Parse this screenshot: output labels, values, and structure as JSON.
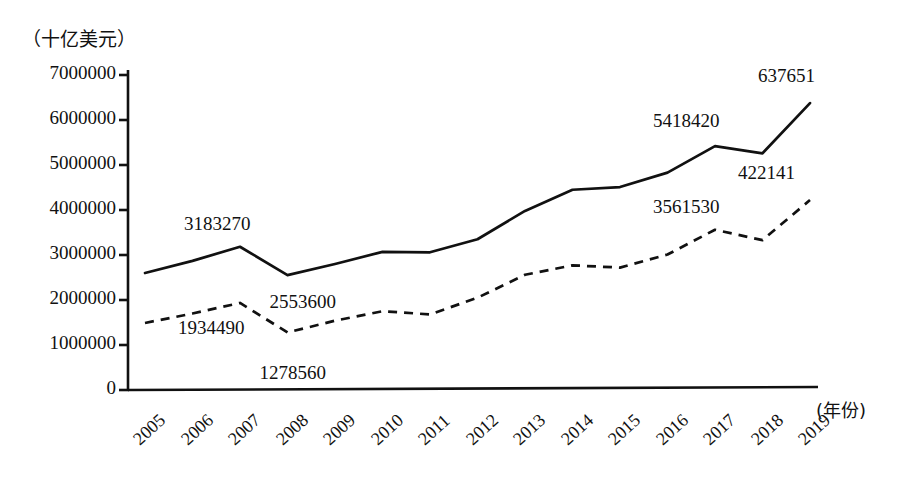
{
  "chart_data": {
    "type": "line",
    "title": "",
    "ylabel": "（十亿美元）",
    "xlabel": "(年份)",
    "ylim": [
      0,
      7000000
    ],
    "ytick_labels": [
      "0",
      "1000000",
      "2000000",
      "3000000",
      "4000000",
      "5000000",
      "6000000",
      "7000000"
    ],
    "ytick_values": [
      0,
      1000000,
      2000000,
      3000000,
      4000000,
      5000000,
      6000000,
      7000000
    ],
    "grid": false,
    "legend_position": "none",
    "categories": [
      "2005",
      "2006",
      "2007",
      "2008",
      "2009",
      "2010",
      "2011",
      "2012",
      "2013",
      "2014",
      "2015",
      "2016",
      "2017",
      "2018",
      "2019"
    ],
    "x": [
      2005,
      2006,
      2007,
      2008,
      2009,
      2010,
      2011,
      2012,
      2013,
      2014,
      2015,
      2016,
      2017,
      2018,
      2019
    ],
    "series": [
      {
        "name": "solid-line",
        "style": "solid",
        "values": [
          2600000,
          2870000,
          3183270,
          2553600,
          2800000,
          3070000,
          3060000,
          3350000,
          3980000,
          4450000,
          4510000,
          4830000,
          5418420,
          5260000,
          6376510
        ]
      },
      {
        "name": "dashed-line",
        "style": "dashed",
        "values": [
          1490000,
          1700000,
          1934490,
          1278560,
          1540000,
          1750000,
          1680000,
          2050000,
          2560000,
          2770000,
          2720000,
          3010000,
          3561530,
          3330000,
          4221410
        ]
      }
    ],
    "annotations": [
      {
        "text": "3183270",
        "series": "solid-line",
        "category": "2007"
      },
      {
        "text": "2553600",
        "series": "solid-line",
        "category": "2008"
      },
      {
        "text": "5418420",
        "series": "solid-line",
        "category": "2017"
      },
      {
        "text": "637651",
        "series": "solid-line",
        "category": "2019"
      },
      {
        "text": "1934490",
        "series": "dashed-line",
        "category": "2007"
      },
      {
        "text": "1278560",
        "series": "dashed-line",
        "category": "2008"
      },
      {
        "text": "3561530",
        "series": "dashed-line",
        "category": "2017"
      },
      {
        "text": "422141",
        "series": "dashed-line",
        "category": "2019"
      }
    ],
    "colors": {
      "line": "#111111",
      "axis": "#111111",
      "background": "#ffffff"
    }
  }
}
